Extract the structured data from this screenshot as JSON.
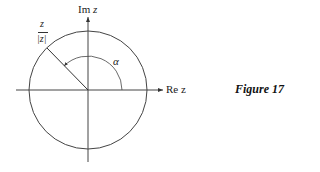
{
  "diagram": {
    "im_axis_label": "Im z",
    "re_axis_label": "Re z",
    "point_label_num": "z",
    "point_label_den": "|z|",
    "angle_label": "α",
    "caption": "Figure 17"
  }
}
